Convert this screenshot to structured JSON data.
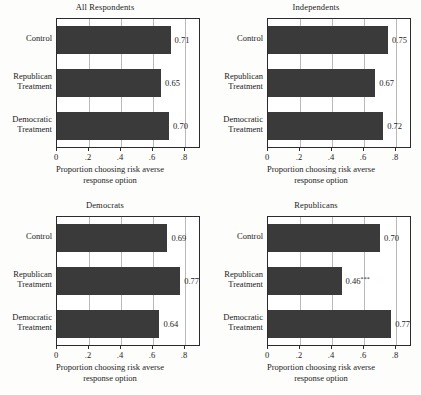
{
  "figure": {
    "bar_color": "#3a3a3a",
    "frame_color": "#2b2b2b",
    "grid_color": "#b9b9b9",
    "background": "#fdfdfb"
  },
  "axis": {
    "tick_labels": [
      "0",
      ".2",
      ".4",
      ".6",
      ".8"
    ],
    "tick_values": [
      0,
      0.2,
      0.4,
      0.6,
      0.8
    ],
    "title_line1": "Proportion choosing risk averse",
    "title_line2": "response option",
    "xmin": 0,
    "xmax": 0.9
  },
  "categories": [
    {
      "line1": "Control",
      "line2": ""
    },
    {
      "line1": "Republican",
      "line2": "Treatment"
    },
    {
      "line1": "Democratic",
      "line2": "Treatment"
    }
  ],
  "panels": [
    {
      "title": "All Respondents",
      "values": [
        0.71,
        0.65,
        0.7
      ],
      "labels": [
        "0.71",
        "0.65",
        "0.70"
      ],
      "stars": [
        "",
        "",
        ""
      ]
    },
    {
      "title": "Independents",
      "values": [
        0.75,
        0.67,
        0.72
      ],
      "labels": [
        "0.75",
        "0.67",
        "0.72"
      ],
      "stars": [
        "",
        "",
        ""
      ]
    },
    {
      "title": "Democrats",
      "values": [
        0.69,
        0.77,
        0.64
      ],
      "labels": [
        "0.69",
        "0.77",
        "0.64"
      ],
      "stars": [
        "",
        "",
        ""
      ]
    },
    {
      "title": "Republicans",
      "values": [
        0.7,
        0.46,
        0.77
      ],
      "labels": [
        "0.70",
        "0.46",
        "0.77"
      ],
      "stars": [
        "",
        "***",
        ""
      ]
    }
  ],
  "chart_data": {
    "type": "bar",
    "title": "",
    "orientation": "horizontal",
    "xlabel": "Proportion choosing risk averse response option",
    "ylabel": "",
    "xlim": [
      0,
      0.9
    ],
    "xticks": [
      0,
      0.2,
      0.4,
      0.6,
      0.8
    ],
    "xticklabels": [
      "0",
      ".2",
      ".4",
      ".6",
      ".8"
    ],
    "grid": "vertical gridlines at x ticks",
    "legend": "none",
    "categories": [
      "Control",
      "Republican Treatment",
      "Democratic Treatment"
    ],
    "panels": [
      {
        "title": "All Respondents",
        "values": [
          0.71,
          0.65,
          0.7
        ],
        "annotations": [
          "0.71",
          "0.65",
          "0.70"
        ]
      },
      {
        "title": "Independents",
        "values": [
          0.75,
          0.67,
          0.72
        ],
        "annotations": [
          "0.75",
          "0.67",
          "0.72"
        ]
      },
      {
        "title": "Democrats",
        "values": [
          0.69,
          0.77,
          0.64
        ],
        "annotations": [
          "0.69",
          "0.77",
          "0.64"
        ]
      },
      {
        "title": "Republicans",
        "values": [
          0.7,
          0.46,
          0.77
        ],
        "annotations": [
          "0.70",
          "0.46***",
          "0.77"
        ]
      }
    ]
  }
}
